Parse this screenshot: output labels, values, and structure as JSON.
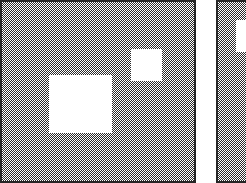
{
  "image": {
    "kind": "dithered-bitmap-panels",
    "width": 246,
    "height": 183,
    "background_color": "#ffffff",
    "dither_color": "#2b2b2b",
    "border_color": "#262626",
    "fill_color": "#ffffff",
    "dither_description": "1-pixel checkerboard halftone (50% gray)",
    "pattern_cell_px": 2
  },
  "panels": [
    {
      "name": "left-panel",
      "label": "",
      "x": 0,
      "y": 0,
      "width": 196,
      "height": 183,
      "border": "left-top-right-bottom",
      "border_width_px": 2,
      "clipped_edges": "bottom",
      "regions": [
        {
          "name": "large-white-region",
          "label": "",
          "x": 49,
          "y": 75,
          "width": 63,
          "height": 58,
          "color": "#ffffff"
        },
        {
          "name": "small-white-region",
          "label": "",
          "x": 131,
          "y": 49,
          "width": 31,
          "height": 32,
          "color": "#ffffff"
        }
      ]
    },
    {
      "name": "right-panel",
      "label": "",
      "x": 216,
      "y": 0,
      "width": 30,
      "height": 183,
      "border": "left-top",
      "border_width_px": 2,
      "clipped_edges": "right, bottom",
      "regions": [
        {
          "name": "white-region",
          "label": "",
          "x": 236,
          "y": 20,
          "width": 10,
          "height": 32,
          "color": "#ffffff"
        }
      ]
    }
  ],
  "gap": {
    "name": "panel-gutter",
    "x": 196,
    "y": 0,
    "width": 20,
    "height": 183,
    "color": "#ffffff"
  }
}
